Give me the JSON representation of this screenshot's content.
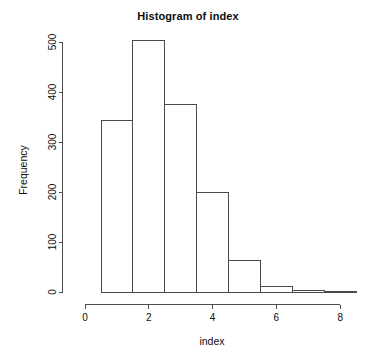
{
  "chart_data": {
    "type": "bar",
    "title": "Histogram of index",
    "xlabel": "index",
    "ylabel": "Frequency",
    "categories": [
      "0.5-1.5",
      "1.5-2.5",
      "2.5-3.5",
      "3.5-4.5",
      "4.5-5.5",
      "5.5-6.5",
      "6.5-7.5",
      "7.5-8.5"
    ],
    "bin_edges": [
      0.5,
      1.5,
      2.5,
      3.5,
      4.5,
      5.5,
      6.5,
      7.5,
      8.5
    ],
    "values": [
      344,
      504,
      375,
      200,
      64,
      11,
      3,
      2
    ],
    "xlim": [
      0,
      8.5
    ],
    "ylim": [
      0,
      500
    ],
    "x_ticks": [
      0,
      2,
      4,
      6,
      8
    ],
    "x_tick_labels": [
      "0",
      "2",
      "4",
      "6",
      "8"
    ],
    "y_ticks": [
      0,
      100,
      200,
      300,
      400,
      500
    ],
    "y_tick_labels": [
      "0",
      "100",
      "200",
      "300",
      "400",
      "500"
    ],
    "grid": false,
    "legend": false,
    "bar_fill_color": "#ffffff",
    "bar_border_color": "#4a4a4a",
    "axis_color": "#4d4d4d",
    "background_color": "#ffffff",
    "text_color": "#0d0d0d"
  }
}
